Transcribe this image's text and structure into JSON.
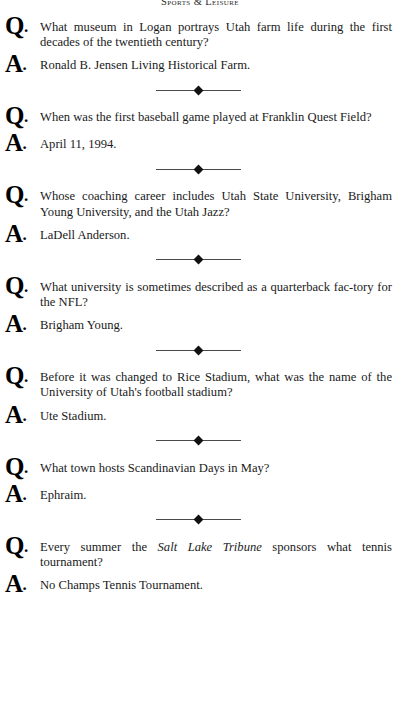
{
  "page": {
    "running_head": "Sports & Leisure",
    "question_marker": "Q",
    "answer_marker": "A",
    "marker_dot": "."
  },
  "entries": [
    {
      "question": "What museum in Logan portrays Utah farm life during the first decades of the twentieth century?",
      "answer": "Ronald B. Jensen Living Historical Farm."
    },
    {
      "question": "When was the first baseball game played at Franklin Quest Field?",
      "answer": "April 11, 1994."
    },
    {
      "question": "Whose coaching career includes Utah State University, Brigham Young University, and the Utah Jazz?",
      "answer": "LaDell Anderson."
    },
    {
      "question": "What university is sometimes described as a quarterback fac-tory for the NFL?",
      "answer": "Brigham Young."
    },
    {
      "question": "Before it was changed to Rice Stadium, what was the name of the University of Utah's football stadium?",
      "answer": "Ute Stadium."
    },
    {
      "question": "What town hosts Scandinavian Days in May?",
      "answer": "Ephraim."
    },
    {
      "question_parts": [
        {
          "text": "Every summer the ",
          "style": "roman"
        },
        {
          "text": "Salt Lake Tribune",
          "style": "italic"
        },
        {
          "text": " sponsors what tennis tournament?",
          "style": "roman"
        }
      ],
      "question": "Every summer the Salt Lake Tribune sponsors what tennis tournament?",
      "answer": "No Champs Tennis Tournament."
    }
  ],
  "divider": {
    "ornament": "diamond"
  },
  "colors": {
    "text": "#1a1a1a",
    "marker": "#000000",
    "rule": "#4a4a4a",
    "background": "#ffffff"
  }
}
